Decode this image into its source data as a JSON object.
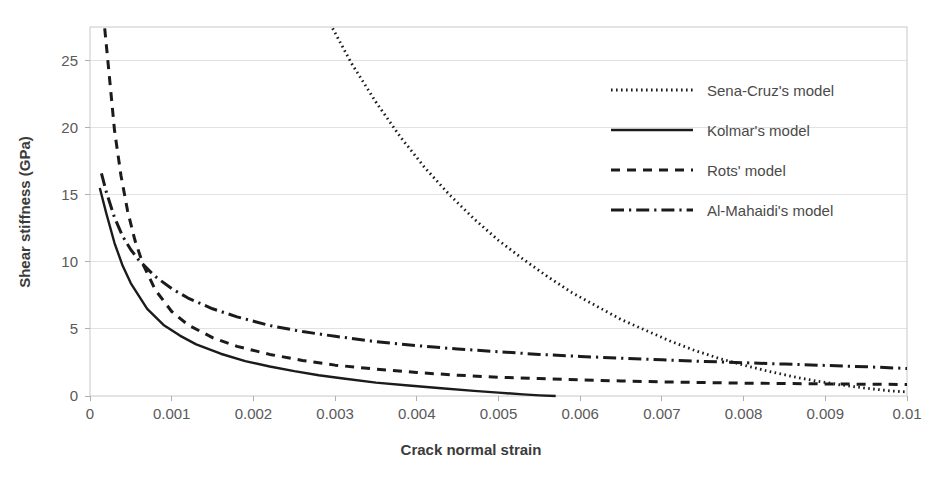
{
  "chart_data": {
    "type": "line",
    "title": "",
    "xlabel": "Crack normal strain",
    "ylabel": "Shear stiffness (GPa)",
    "xlim": [
      0,
      0.01
    ],
    "ylim": [
      0,
      27.5
    ],
    "xticks": [
      "0",
      "0.001",
      "0.002",
      "0.003",
      "0.004",
      "0.005",
      "0.006",
      "0.007",
      "0.008",
      "0.009",
      "0.01"
    ],
    "xtick_values": [
      0,
      0.001,
      0.002,
      0.003,
      0.004,
      0.005,
      0.006,
      0.007,
      0.008,
      0.009,
      0.01
    ],
    "yticks": [
      "0",
      "5",
      "10",
      "15",
      "20",
      "25"
    ],
    "ytick_values": [
      0,
      5,
      10,
      15,
      20,
      25
    ],
    "grid": "horizontal",
    "legend_position": "upper-right-inside",
    "series": [
      {
        "name": "Sena-Cruz's model",
        "style": "dotted",
        "color": "#1b1b1b",
        "x": [
          0.00297,
          0.0032,
          0.0035,
          0.0038,
          0.0041,
          0.0044,
          0.0047,
          0.005,
          0.0053,
          0.0056,
          0.0059,
          0.0062,
          0.0065,
          0.0068,
          0.0071,
          0.0074,
          0.0077,
          0.008,
          0.0083,
          0.0086,
          0.0089,
          0.0092,
          0.0095,
          0.0098,
          0.01
        ],
        "y": [
          27.4,
          24.8,
          21.9,
          19.3,
          17.0,
          15.0,
          13.2,
          11.6,
          10.2,
          8.9,
          7.7,
          6.7,
          5.7,
          4.9,
          4.1,
          3.4,
          2.8,
          2.3,
          1.85,
          1.45,
          1.1,
          0.82,
          0.58,
          0.38,
          0.3
        ]
      },
      {
        "name": "Kolmar's model",
        "style": "solid",
        "color": "#1b1b1b",
        "x": [
          0.00012,
          0.0002,
          0.0003,
          0.0004,
          0.0005,
          0.0007,
          0.0009,
          0.0011,
          0.0013,
          0.0016,
          0.0019,
          0.0022,
          0.0025,
          0.0028,
          0.0031,
          0.0035,
          0.0039,
          0.0043,
          0.0047,
          0.005,
          0.0053,
          0.0055,
          0.0057
        ],
        "y": [
          15.5,
          13.6,
          11.4,
          9.7,
          8.4,
          6.5,
          5.3,
          4.5,
          3.85,
          3.15,
          2.6,
          2.2,
          1.85,
          1.55,
          1.3,
          1.0,
          0.78,
          0.58,
          0.38,
          0.25,
          0.12,
          0.05,
          0.0
        ]
      },
      {
        "name": "Rots' model",
        "style": "dashed",
        "color": "#1b1b1b",
        "x": [
          0.00018,
          0.00025,
          0.0003,
          0.00038,
          0.00046,
          0.00055,
          0.00065,
          0.0008,
          0.001,
          0.0012,
          0.0015,
          0.0018,
          0.0022,
          0.0026,
          0.003,
          0.0035,
          0.004,
          0.0045,
          0.005,
          0.0055,
          0.006,
          0.0065,
          0.007,
          0.0075,
          0.008,
          0.0085,
          0.009,
          0.0095,
          0.01
        ],
        "y": [
          27.4,
          23.0,
          19.8,
          16.4,
          13.8,
          11.6,
          9.8,
          7.9,
          6.3,
          5.3,
          4.35,
          3.7,
          3.1,
          2.65,
          2.3,
          2.0,
          1.75,
          1.55,
          1.4,
          1.3,
          1.2,
          1.12,
          1.05,
          1.0,
          0.96,
          0.93,
          0.9,
          0.88,
          0.86
        ]
      },
      {
        "name": "Al-Mahaidi's model",
        "style": "dashdot",
        "color": "#1b1b1b",
        "x": [
          0.00014,
          0.0002,
          0.0003,
          0.0004,
          0.0005,
          0.0006,
          0.0008,
          0.001,
          0.0012,
          0.0015,
          0.0018,
          0.0022,
          0.0026,
          0.003,
          0.0035,
          0.004,
          0.0045,
          0.005,
          0.0055,
          0.006,
          0.0065,
          0.007,
          0.0075,
          0.008,
          0.0085,
          0.009,
          0.0095,
          0.01
        ],
        "y": [
          16.6,
          15.2,
          13.3,
          11.9,
          10.9,
          10.1,
          8.9,
          8.0,
          7.3,
          6.5,
          5.9,
          5.25,
          4.8,
          4.45,
          4.05,
          3.75,
          3.5,
          3.3,
          3.1,
          2.95,
          2.82,
          2.7,
          2.58,
          2.48,
          2.38,
          2.28,
          2.18,
          2.05
        ]
      }
    ],
    "legend": [
      {
        "label": "Sena-Cruz's model",
        "style": "dotted"
      },
      {
        "label": "Kolmar's model",
        "style": "solid"
      },
      {
        "label": "Rots' model",
        "style": "dashed"
      },
      {
        "label": "Al-Mahaidi's model",
        "style": "dashdot"
      }
    ]
  },
  "colors": {
    "line": "#1b1b1b",
    "grid": "#e2e2e2",
    "border": "#c8c8c8",
    "text": "#4a4a4a",
    "background": "#ffffff"
  }
}
